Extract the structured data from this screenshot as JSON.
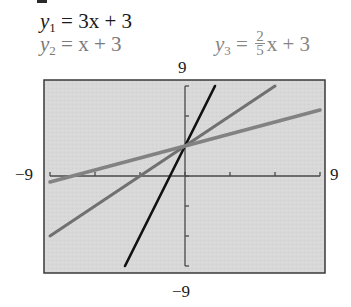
{
  "equations": {
    "y1": {
      "lhs": "y",
      "sub": "1",
      "rhs": "= 3x + 3",
      "color": "#1a1a1a"
    },
    "y2": {
      "lhs": "y",
      "sub": "2",
      "rhs": "= x + 3",
      "color": "#7a7a7a"
    },
    "y3": {
      "lhs": "y",
      "sub": "3",
      "eq": "=",
      "frac_num": "2",
      "frac_den": "5",
      "rest": "x + 3",
      "color": "#858585"
    }
  },
  "window_labels": {
    "ymax": "9",
    "ymin": "−9",
    "xmin": "−9",
    "xmax": "9"
  },
  "colors": {
    "background": "#d8d8d8",
    "frame": "#3a3a3a",
    "axis": "#4a4a4a",
    "y1": "#111111",
    "y2": "#707070",
    "y3": "#828282"
  },
  "chart_data": {
    "type": "line",
    "title": "",
    "xlabel": "",
    "ylabel": "",
    "xlim": [
      -9,
      9
    ],
    "ylim": [
      -9,
      9
    ],
    "xscale_ticks": 3,
    "yscale_ticks": 3,
    "grid": false,
    "legend_position": "top (equation labels above graph)",
    "series": [
      {
        "name": "y1 = 3x + 3",
        "slope": 3,
        "intercept": 3,
        "x": [
          -4,
          2
        ],
        "y": [
          -9,
          9
        ]
      },
      {
        "name": "y2 = x + 3",
        "slope": 1,
        "intercept": 3,
        "x": [
          -9,
          6
        ],
        "y": [
          -6,
          9
        ]
      },
      {
        "name": "y3 = (2/5)x + 3",
        "slope": 0.4,
        "intercept": 3,
        "x": [
          -9,
          9
        ],
        "y": [
          -0.6,
          6.6
        ]
      }
    ],
    "annotations": [
      "All three lines intersect at (0, 3)"
    ]
  }
}
